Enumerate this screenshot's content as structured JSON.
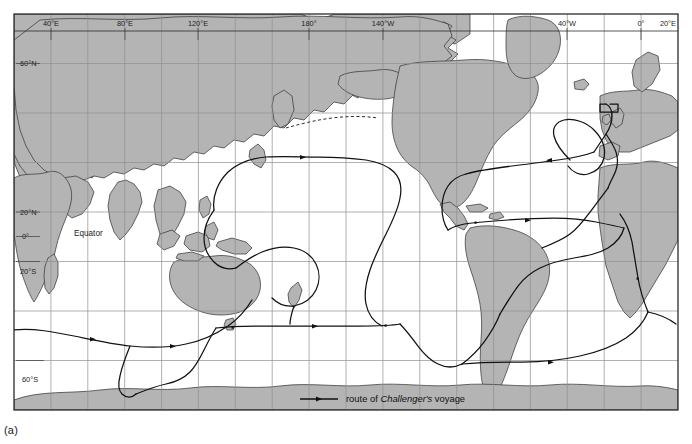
{
  "figure": {
    "caption": "(a)",
    "map_type": "world-map",
    "projection": "equirectangular",
    "frame": {
      "x": 14,
      "y": 14,
      "width": 664,
      "height": 396
    },
    "colors": {
      "land": "#b4b4b4",
      "land_outline": "#3a3a3a",
      "ocean": "#ffffff",
      "graticule": "#8f8f8f",
      "frame": "#2b2b2b",
      "route": "#111111",
      "page_background": "#ffffff",
      "text": "#1d1d1d"
    }
  },
  "graticule": {
    "longitude_interval_deg": 20,
    "latitude_interval_deg": 20,
    "west_edge_deg": 20,
    "east_edge_deg": 20,
    "north_edge_deg": 80,
    "south_edge_deg": -80,
    "top_labels": [
      {
        "text": "40°E",
        "lon": 40
      },
      {
        "text": "80°E",
        "lon": 80
      },
      {
        "text": "120°E",
        "lon": 120
      },
      {
        "text": "180°",
        "lon": 180
      },
      {
        "text": "140°W",
        "lon": -140
      },
      {
        "text": "40°W",
        "lon": -40
      },
      {
        "text": "0°",
        "lon": 0
      },
      {
        "text": "20°E",
        "lon": 20
      }
    ],
    "left_labels": [
      {
        "text": "60°N",
        "lat": 60
      },
      {
        "text": "20°N",
        "lat": 20
      },
      {
        "text": "0°",
        "lat": 0
      },
      {
        "text": "20°S",
        "lat": -20
      },
      {
        "text": "60°S",
        "lat": -60
      }
    ],
    "annotations": [
      {
        "name": "equator-label",
        "text": "Equator",
        "lat": 0
      }
    ]
  },
  "legend": {
    "prefix": "route of ",
    "emphasis": "Challenger's",
    "suffix": " voyage",
    "marker": "line-with-arrow"
  }
}
